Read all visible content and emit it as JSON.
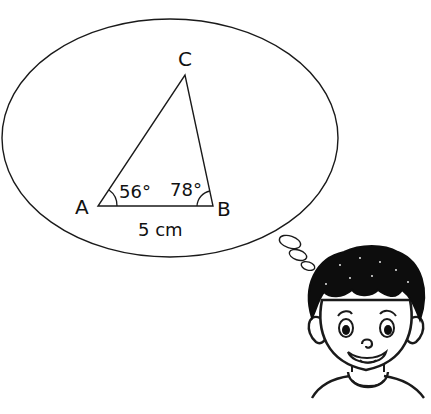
{
  "diagram": {
    "vertices": {
      "A": {
        "label": "A"
      },
      "B": {
        "label": "B"
      },
      "C": {
        "label": "C"
      }
    },
    "angles": {
      "A": "56°",
      "B": "78°"
    },
    "side_AB": "5 cm"
  },
  "colors": {
    "stroke": "#1a1a1a",
    "background": "#ffffff",
    "hair": "#0d0d0d"
  }
}
